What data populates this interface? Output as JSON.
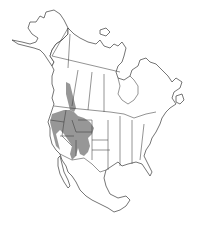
{
  "map": {
    "subject": "North America species range map",
    "region_shown": "North America (Alaska, Canada, United States, Mexico)",
    "range_fill_color": "#8c8c8c",
    "outline_color": "#3a3a3a",
    "background_color": "#ffffff",
    "range_description": "Western interior: Great Basin, Rocky Mountains, extending north through Idaho/Montana into southern British Columbia and Alberta; south into Nevada, Utah, Arizona, western Colorado and New Mexico"
  }
}
